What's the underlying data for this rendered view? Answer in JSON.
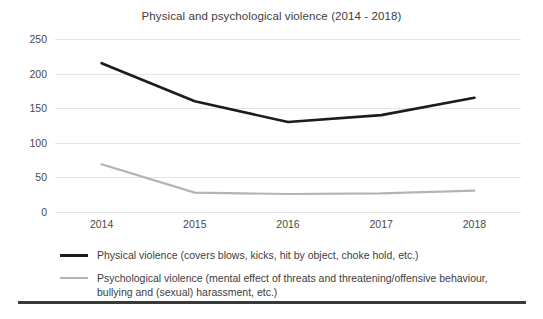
{
  "chart_data": {
    "type": "line",
    "title": "Physical and psychological violence (2014 - 2018)",
    "xlabel": "",
    "ylabel": "",
    "categories": [
      "2014",
      "2015",
      "2016",
      "2017",
      "2018"
    ],
    "x": [
      2014,
      2015,
      2016,
      2017,
      2018
    ],
    "series": [
      {
        "name": "Physical violence (covers blows,  kicks, hit by object, choke hold, etc.)",
        "short_name": "Physical violence",
        "color": "#1c1c1c",
        "values": [
          215,
          160,
          130,
          140,
          165
        ]
      },
      {
        "name": "Psychological violence (mental effect of threats and threatening/offensive behaviour, bullying and (sexual) harassment, etc.)",
        "short_name": "Psychological violence",
        "color": "#b4b4b4",
        "values": [
          69,
          28,
          26,
          27,
          31
        ]
      }
    ],
    "ylim": [
      0,
      250
    ],
    "yticks": [
      0,
      50,
      100,
      150,
      200,
      250
    ],
    "ytick_labels": [
      "0",
      "50",
      "100",
      "150",
      "200",
      "250"
    ],
    "grid": "horizontal",
    "legend_position": "bottom"
  },
  "legend": {
    "entries": [
      {
        "swatch": "solid-black-line",
        "label": "Physical violence (covers blows,  kicks, hit by object, choke hold, etc.)"
      },
      {
        "swatch": "solid-gray-line",
        "label": "Psychological violence (mental effect of threats and threatening/offensive behaviour, bullying and (sexual) harassment, etc.)"
      }
    ]
  }
}
